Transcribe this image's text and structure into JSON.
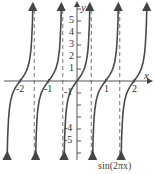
{
  "chart_data": {
    "type": "line",
    "function": "tan(pi*x)",
    "title": "",
    "xlabel": "x",
    "ylabel": "y",
    "xlim": [
      -2.6,
      2.6
    ],
    "ylim": [
      -5.8,
      5.8
    ],
    "x_ticks": [
      -2,
      -1,
      1,
      2
    ],
    "x_tick_labels": [
      "-2",
      "-1",
      "1",
      "2"
    ],
    "y_ticks": [
      1,
      2,
      3,
      4,
      5,
      -1,
      -4,
      -5
    ],
    "y_tick_labels": [
      "1",
      "2",
      "3",
      "4",
      "5",
      "-1",
      "-4",
      "-5"
    ],
    "asymptotes_x": [
      -1.5,
      -0.5,
      0.5,
      1.5
    ],
    "zeros_x": [
      -2,
      -1,
      0,
      1,
      2
    ],
    "grid": false,
    "legend": "none",
    "caption": "sin(2πx)"
  },
  "labels": {
    "x_axis": "x",
    "y_axis": "y",
    "xt_m2": "-2",
    "xt_m1": "-1",
    "xt_1": "1",
    "xt_2": "2",
    "yt_1": "1",
    "yt_2": "2",
    "yt_3": "3",
    "yt_4": "4",
    "yt_5": "5",
    "yt_m1": "-1",
    "yt_m4": "-4",
    "yt_m5": "-5",
    "caption": "sin(2πx)"
  },
  "colors": {
    "curve": "#4a4a4a",
    "axis": "#555555",
    "asymptote": "#777777"
  }
}
